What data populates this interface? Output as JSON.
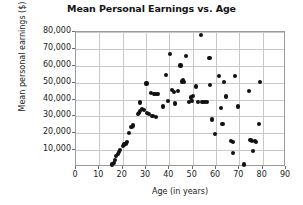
{
  "chart_data": {
    "type": "scatter",
    "title": "Mean Personal Earnings vs. Age",
    "xlabel": "Age (in years)",
    "ylabel": "Mean personal earnings ($)",
    "xlim": [
      0,
      90
    ],
    "ylim": [
      0,
      80000
    ],
    "xticks": [
      0,
      10,
      20,
      30,
      40,
      50,
      60,
      70,
      80,
      90
    ],
    "xtick_labels": [
      "0",
      "10",
      "20",
      "30",
      "40",
      "50",
      "60",
      "70",
      "80",
      "90"
    ],
    "yticks": [
      10000,
      20000,
      30000,
      40000,
      50000,
      60000,
      70000,
      80000
    ],
    "ytick_labels": [
      "10,000",
      "20,000",
      "30,000",
      "40,000",
      "50,000",
      "60,000",
      "70,000",
      "80,000"
    ],
    "grid": true,
    "legend": null,
    "marker_color": "#111111",
    "points": [
      [
        15.5,
        1500
      ],
      [
        16.2,
        2600
      ],
      [
        16.8,
        4200
      ],
      [
        17.3,
        6500
      ],
      [
        17.9,
        7600
      ],
      [
        18.4,
        8800
      ],
      [
        19.0,
        10200
      ],
      [
        20.0,
        12600
      ],
      [
        20.6,
        13300
      ],
      [
        21.2,
        13800
      ],
      [
        21.8,
        14600
      ],
      [
        22.6,
        20300
      ],
      [
        23.8,
        23800
      ],
      [
        24.3,
        24600
      ],
      [
        26.4,
        31400
      ],
      [
        27.0,
        32000
      ],
      [
        27.3,
        33400
      ],
      [
        27.6,
        38200
      ],
      [
        28.2,
        34600
      ],
      [
        29.0,
        34000
      ],
      [
        30.2,
        49500
      ],
      [
        30.6,
        32000
      ],
      [
        31.4,
        31200
      ],
      [
        32.3,
        43900
      ],
      [
        32.8,
        30100
      ],
      [
        33.4,
        43300
      ],
      [
        33.9,
        43300
      ],
      [
        34.4,
        29400
      ],
      [
        34.9,
        43400
      ],
      [
        37.4,
        35800
      ],
      [
        38.4,
        54300
      ],
      [
        39.3,
        39200
      ],
      [
        40.2,
        67200
      ],
      [
        41.2,
        45400
      ],
      [
        41.9,
        44400
      ],
      [
        42.4,
        37600
      ],
      [
        43.7,
        45100
      ],
      [
        44.8,
        60100
      ],
      [
        45.4,
        50700
      ],
      [
        45.9,
        51300
      ],
      [
        46.4,
        50400
      ],
      [
        47.0,
        66000
      ],
      [
        48.4,
        38600
      ],
      [
        49.2,
        41200
      ],
      [
        49.8,
        39100
      ],
      [
        50.3,
        42000
      ],
      [
        51.6,
        47700
      ],
      [
        52.4,
        38300
      ],
      [
        53.4,
        78300
      ],
      [
        54.2,
        38400
      ],
      [
        55.3,
        38300
      ],
      [
        56.3,
        38700
      ],
      [
        57.2,
        64800
      ],
      [
        57.6,
        48500
      ],
      [
        58.4,
        28100
      ],
      [
        59.4,
        19400
      ],
      [
        61.3,
        53900
      ],
      [
        62.2,
        35000
      ],
      [
        62.8,
        25300
      ],
      [
        63.3,
        50300
      ],
      [
        64.4,
        41800
      ],
      [
        66.5,
        15600
      ],
      [
        67.2,
        14800
      ],
      [
        67.4,
        8400
      ],
      [
        68.3,
        53900
      ],
      [
        69.4,
        35900
      ],
      [
        71.9,
        1500
      ],
      [
        74.3,
        45100
      ],
      [
        74.8,
        16200
      ],
      [
        75.4,
        15600
      ],
      [
        76.0,
        9400
      ],
      [
        76.6,
        15200
      ],
      [
        77.3,
        14700
      ],
      [
        78.3,
        25300
      ],
      [
        79.0,
        50600
      ]
    ]
  }
}
